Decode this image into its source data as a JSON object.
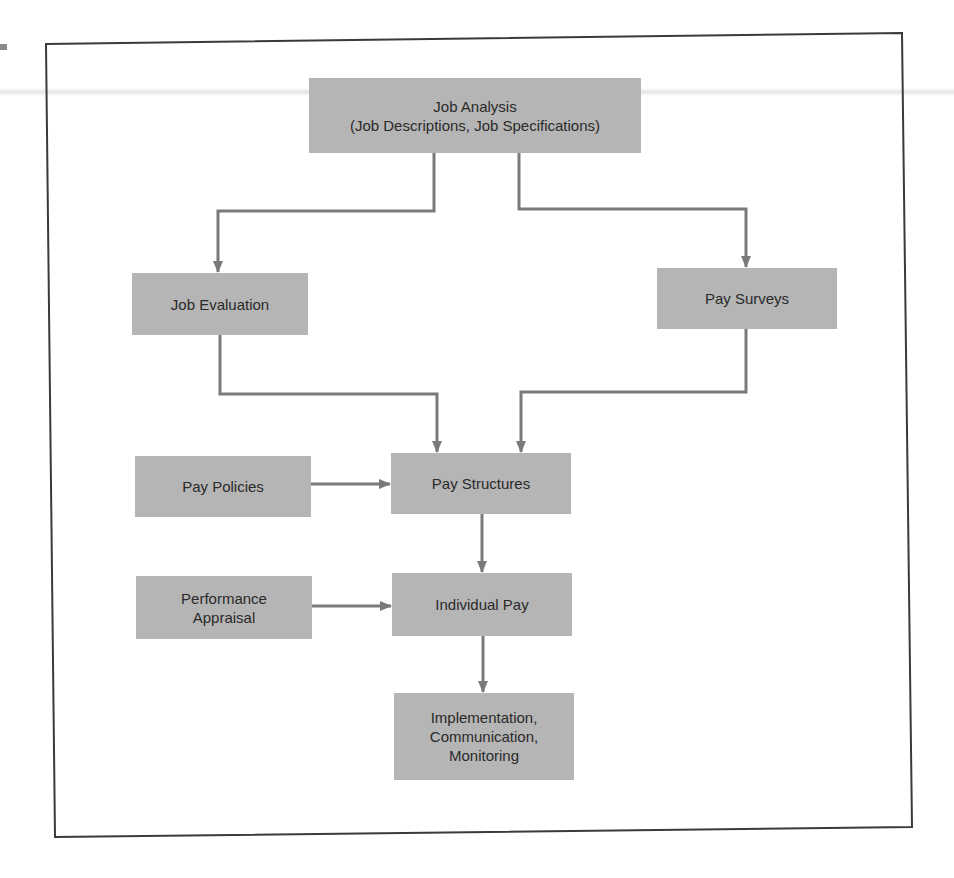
{
  "diagram": {
    "type": "flowchart",
    "nodes": [
      {
        "id": "job_analysis",
        "label": "Job Analysis\n(Job Descriptions, Job Specifications)"
      },
      {
        "id": "job_evaluation",
        "label": "Job Evaluation"
      },
      {
        "id": "pay_surveys",
        "label": "Pay Surveys"
      },
      {
        "id": "pay_policies",
        "label": "Pay Policies"
      },
      {
        "id": "pay_structures",
        "label": "Pay Structures"
      },
      {
        "id": "performance_appraisal",
        "label": "Performance\nAppraisal"
      },
      {
        "id": "individual_pay",
        "label": "Individual Pay"
      },
      {
        "id": "implementation",
        "label": "Implementation,\nCommunication,\nMonitoring"
      }
    ],
    "edges": [
      {
        "from": "job_analysis",
        "to": "job_evaluation"
      },
      {
        "from": "job_analysis",
        "to": "pay_surveys"
      },
      {
        "from": "job_evaluation",
        "to": "pay_structures"
      },
      {
        "from": "pay_surveys",
        "to": "pay_structures"
      },
      {
        "from": "pay_policies",
        "to": "pay_structures"
      },
      {
        "from": "pay_structures",
        "to": "individual_pay"
      },
      {
        "from": "performance_appraisal",
        "to": "individual_pay"
      },
      {
        "from": "individual_pay",
        "to": "implementation"
      }
    ],
    "colors": {
      "box_fill": "#b5b5b5",
      "connector": "#7a7a7a",
      "frame": "#3a3a3a",
      "text": "#2a2a2a"
    }
  }
}
